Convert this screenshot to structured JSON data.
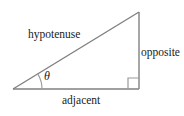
{
  "diagram": {
    "type": "right-triangle-trigonometry",
    "background_color": "#ffffff",
    "line_color": "#808080",
    "text_color": "#1a1a1a",
    "labels": {
      "hypotenuse": "hypotenuse",
      "opposite": "opposite",
      "adjacent": "adjacent",
      "angle": "θ"
    },
    "geometry": {
      "left_vertex": [
        13,
        89
      ],
      "right_angle_vertex": [
        139,
        89
      ],
      "apex_vertex": [
        139,
        12
      ],
      "right_angle_marker": {
        "x": 128,
        "y": 78,
        "size": 11
      },
      "angle_arc": {
        "center": [
          13,
          89
        ],
        "radius": 29,
        "start_deg": 0,
        "end_deg": 31
      }
    }
  }
}
